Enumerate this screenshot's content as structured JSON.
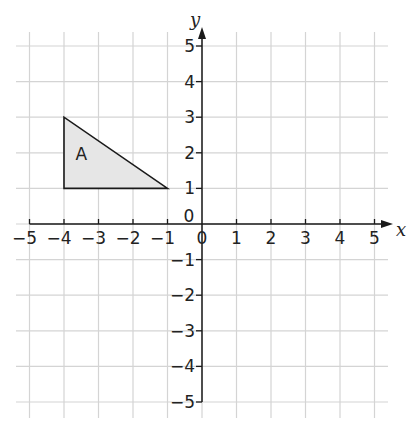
{
  "chart_data": {
    "type": "coordinate-grid",
    "title": "",
    "xlabel": "x",
    "ylabel": "y",
    "xlim": [
      -5,
      5
    ],
    "ylim": [
      -5,
      5
    ],
    "grid": true,
    "x_ticks": [
      "-5",
      "-4",
      "-3",
      "-2",
      "-1",
      "0",
      "1",
      "2",
      "3",
      "4",
      "5"
    ],
    "y_ticks": [
      "-5",
      "-4",
      "-3",
      "-2",
      "-1",
      "0",
      "1",
      "2",
      "3",
      "4",
      "5"
    ],
    "shapes": [
      {
        "name": "A",
        "type": "triangle",
        "vertices": [
          [
            -4,
            3
          ],
          [
            -4,
            1
          ],
          [
            -1,
            1
          ]
        ],
        "label_position": [
          -3.5,
          1.8
        ],
        "fill": "#e6e6e6",
        "stroke": "#1a1a1a"
      }
    ]
  },
  "colors": {
    "grid": "#d4d4d4",
    "axis": "#1a1a1a",
    "background": "#ffffff"
  }
}
